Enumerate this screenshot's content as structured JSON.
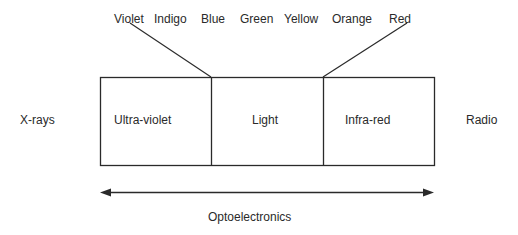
{
  "spectrum_colors": [
    "Violet",
    "Indigo",
    "Blue",
    "Green",
    "Yellow",
    "Orange",
    "Red"
  ],
  "outer_labels": {
    "left": "X-rays",
    "right": "Radio"
  },
  "boxes": [
    {
      "label": "Ultra-violet"
    },
    {
      "label": "Light"
    },
    {
      "label": "Infra-red"
    }
  ],
  "range_label": "Optoelectronics",
  "colors": {
    "line": "#2a2a2a",
    "background": "#ffffff"
  }
}
